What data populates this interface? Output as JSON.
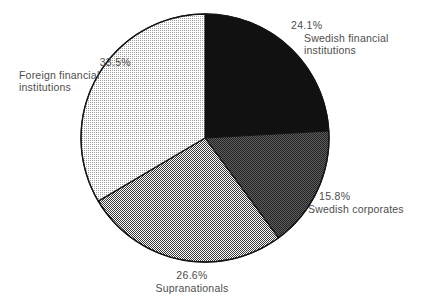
{
  "chart_data": {
    "type": "pie",
    "title": "",
    "subtitle": "",
    "xlabel": "",
    "ylabel": "",
    "legend_position": "none",
    "grid": false,
    "start_angle_deg": 0,
    "direction": "clockwise",
    "categories": [
      "Swedish financial institutions",
      "Swedish corporates",
      "Supranationals",
      "Foreign financial institutions"
    ],
    "values": [
      24.1,
      15.8,
      26.6,
      33.5
    ],
    "value_labels": [
      "24.1%",
      "15.8%",
      "26.6%",
      "33.5%"
    ],
    "units": "percent",
    "slices": [
      {
        "label": "Swedish financial institutions",
        "value": 24.1,
        "value_label": "24.1%",
        "color": "#111111",
        "fill_style": "solid-black",
        "label_position": "top-right"
      },
      {
        "label": "Swedish corporates",
        "value": 15.8,
        "value_label": "15.8%",
        "color": "#3c3c3c",
        "fill_style": "dark-dither",
        "label_position": "right"
      },
      {
        "label": "Supranationals",
        "value": 26.6,
        "value_label": "26.6%",
        "color": "#9a9a9a",
        "fill_style": "medium-dither",
        "label_position": "bottom"
      },
      {
        "label": "Foreign financial institutions",
        "value": 33.5,
        "value_label": "33.5%",
        "color": "#dcdcdc",
        "fill_style": "light-dither",
        "label_position": "left"
      }
    ]
  },
  "labels": {
    "swedish_financial": {
      "percent": "24.1%",
      "name_line1": "Swedish financial",
      "name_line2": "institutions"
    },
    "swedish_corporates": {
      "percent": "15.8%",
      "name_line1": "Swedish corporates"
    },
    "supranationals": {
      "percent": "26.6%",
      "name_line1": "Supranationals"
    },
    "foreign_financial": {
      "percent": "33.5%",
      "name_line1": "Foreign financial",
      "name_line2": "institutions"
    }
  },
  "colors": {
    "background": "#ffffff",
    "text": "#4d4d4d",
    "outline": "#1a1a1a",
    "slice_black": "#111111",
    "slice_dark_gray": "#3c3c3c",
    "slice_medium_gray": "#9a9a9a",
    "slice_light_gray": "#dcdcdc"
  }
}
